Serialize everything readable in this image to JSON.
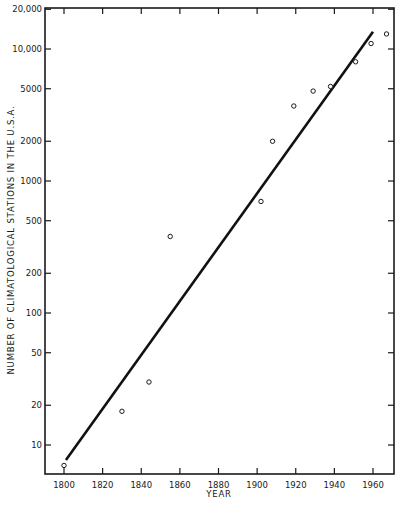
{
  "chart_data": {
    "type": "scatter",
    "title": "",
    "xlabel": "YEAR",
    "ylabel": "NUMBER OF CLIMATOLOGICAL STATIONS IN THE U.S.A.",
    "x_ticks": [
      1800,
      1820,
      1840,
      1860,
      1880,
      1900,
      1920,
      1940,
      1960
    ],
    "x_tick_labels": [
      "1800",
      "1820",
      "1840",
      "1860",
      "1880",
      "1900",
      "1920",
      "1940",
      "1960"
    ],
    "y_ticks": [
      10,
      20,
      50,
      100,
      200,
      500,
      1000,
      2000,
      5000,
      10000,
      20000
    ],
    "y_tick_labels": [
      "10",
      "20",
      "50",
      "100",
      "200",
      "500",
      "1000",
      "2000",
      "5000",
      "10,000",
      "20,000"
    ],
    "yscale": "log",
    "xlim": [
      1790,
      1972
    ],
    "ylim": [
      5.5,
      20000
    ],
    "grid": false,
    "legend": null,
    "series": [
      {
        "name": "Observed stations",
        "kind": "scatter",
        "marker": "open-circle",
        "x": [
          1800,
          1830,
          1844,
          1855,
          1902,
          1908,
          1919,
          1929,
          1938,
          1951,
          1959,
          1967
        ],
        "y": [
          7,
          18,
          30,
          380,
          700,
          2000,
          3700,
          4800,
          5200,
          8000,
          11000,
          13000
        ]
      },
      {
        "name": "Exponential fit",
        "kind": "line",
        "x": [
          1801,
          1960
        ],
        "y": [
          7.7,
          13500
        ]
      }
    ]
  }
}
